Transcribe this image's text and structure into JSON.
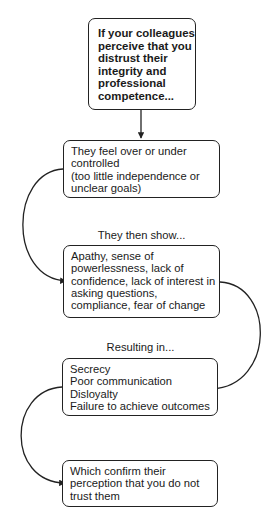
{
  "diagram": {
    "type": "flowchart-cycle",
    "colors": {
      "stroke": "#222222",
      "text": "#1a1a1a",
      "background": "#ffffff"
    },
    "nodes": [
      {
        "id": "perception",
        "lines": [
          "If your colleagues",
          "perceive that you",
          "distrust their",
          "integrity and",
          "professional",
          "competence..."
        ],
        "bold": true
      },
      {
        "id": "feel",
        "lines": [
          "They feel over or under",
          "controlled",
          "(too little independence or",
          "unclear goals)"
        ]
      },
      {
        "id": "show",
        "lines": [
          "Apathy, sense of",
          "powerlessness, lack of",
          "confidence, lack of interest in",
          "asking questions,",
          "compliance, fear of change"
        ]
      },
      {
        "id": "result",
        "lines": [
          "Secrecy",
          "Poor communication",
          "Disloyalty",
          "Failure to achieve outcomes"
        ]
      },
      {
        "id": "confirm",
        "lines": [
          "Which confirm their",
          "perception that you do not",
          "trust them"
        ]
      }
    ],
    "edge_labels": {
      "show": "They then show...",
      "result": "Resulting in..."
    },
    "edges": [
      {
        "from": "perception",
        "to": "feel",
        "style": "straight"
      },
      {
        "from": "feel",
        "to": "show",
        "style": "curve-left"
      },
      {
        "from": "show",
        "to": "result",
        "style": "curve-right"
      },
      {
        "from": "result",
        "to": "confirm",
        "style": "curve-left"
      }
    ]
  }
}
